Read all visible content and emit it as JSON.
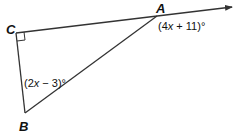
{
  "diagram": {
    "type": "geometry-triangle",
    "vertices": {
      "A": {
        "label": "A"
      },
      "B": {
        "label": "B"
      },
      "C": {
        "label": "C"
      }
    },
    "right_angle_at": "C",
    "ray": {
      "from": "C",
      "through": "A",
      "arrow": true
    },
    "angles": {
      "exterior_A": {
        "open": "(4",
        "var": "x",
        "rest": " + 11)°"
      },
      "B": {
        "open": "(2",
        "var": "x",
        "rest": " − 3)°"
      }
    },
    "colors": {
      "line": "#333333",
      "text": "#111111",
      "background": "#ffffff"
    }
  }
}
